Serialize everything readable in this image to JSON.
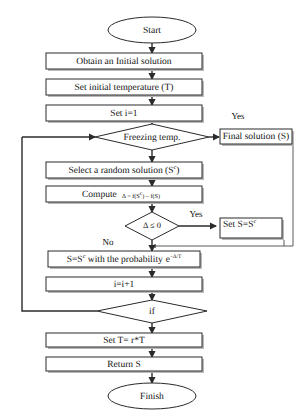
{
  "diagram": {
    "type": "flowchart",
    "background_color": "#ffffff",
    "line_color": "#2b2b2b",
    "shape_fill": "#ffffff"
  },
  "nodes": {
    "start": {
      "label": "Start",
      "shape": "terminator"
    },
    "obtain_initial": {
      "label": "Obtain an Initial solution",
      "shape": "process"
    },
    "set_temperature": {
      "label": "Set initial temperature (T)",
      "shape": "process"
    },
    "set_i": {
      "label": "Set i=1",
      "shape": "process"
    },
    "freezing": {
      "label": "Freezing temp.",
      "shape": "decision"
    },
    "final_solution": {
      "label": "Final solution (S)",
      "shape": "process"
    },
    "select_random": {
      "label_main": "Select a random solution (S",
      "label_sup": "c",
      "label_tail": ")",
      "shape": "process"
    },
    "compute": {
      "label_main": "Compute",
      "formula_prefix": "Δ = f(S",
      "formula_sup": "c",
      "formula_mid": ") – f(S)",
      "shape": "process"
    },
    "delta_check": {
      "label": "Δ ≤ 0",
      "shape": "decision"
    },
    "set_s": {
      "label_main": "Set S=S",
      "label_sup": "c",
      "shape": "process"
    },
    "probability": {
      "label_prefix": "S=S",
      "label_sup": "c",
      "label_mid": " with the probability",
      "label_exp_base": "e",
      "label_exp_sup": "−Δ/T",
      "shape": "process"
    },
    "increment": {
      "label": "i=i+1",
      "shape": "process"
    },
    "if_check": {
      "label": "if",
      "shape": "decision"
    },
    "set_t": {
      "label": "Set T= r*T",
      "shape": "process"
    },
    "return_s": {
      "label": "Return S",
      "shape": "process"
    },
    "finish": {
      "label": "Finish",
      "shape": "terminator"
    }
  },
  "edge_labels": {
    "freezing_yes": "Yes",
    "delta_yes": "Yes",
    "delta_no": "No"
  }
}
